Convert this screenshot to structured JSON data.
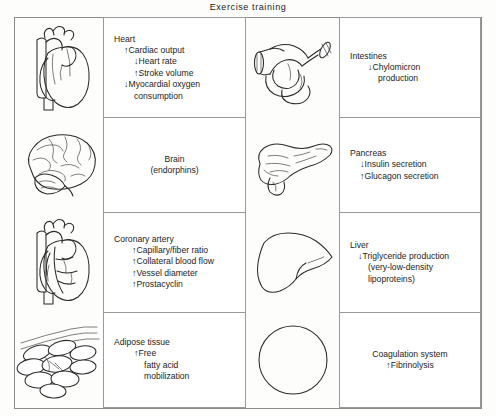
{
  "figure": {
    "title": "Exercise training"
  },
  "panels": [
    {
      "id": "heart",
      "illustration": "heart-anterior-illustration",
      "organ": "Heart",
      "effects": [
        {
          "arrow": "↑",
          "text": "Cardiac output"
        },
        {
          "arrow": "↓",
          "text": "Heart rate"
        },
        {
          "arrow": "↑",
          "text": "Stroke volume"
        },
        {
          "arrow": "↓",
          "text": "Myocardial oxygen"
        },
        {
          "arrow": "",
          "text": "consumption"
        }
      ]
    },
    {
      "id": "intestines",
      "illustration": "intestines-illustration",
      "organ": "Intestines",
      "effects": [
        {
          "arrow": "↓",
          "text": "Chylomicron"
        },
        {
          "arrow": "",
          "text": "production"
        }
      ]
    },
    {
      "id": "brain",
      "illustration": "brain-lateral-illustration",
      "organ": "Brain",
      "effects": [
        {
          "arrow": "",
          "text": "(endorphins)"
        }
      ]
    },
    {
      "id": "pancreas",
      "illustration": "pancreas-illustration",
      "organ": "Pancreas",
      "effects": [
        {
          "arrow": "↓",
          "text": "Insulin secretion"
        },
        {
          "arrow": "↑",
          "text": "Glucagon secretion"
        }
      ]
    },
    {
      "id": "coronary-artery",
      "illustration": "heart-coronary-vessels-illustration",
      "organ": "Coronary artery",
      "effects": [
        {
          "arrow": "↑",
          "text": "Capillary/fiber ratio"
        },
        {
          "arrow": "↑",
          "text": "Collateral blood flow"
        },
        {
          "arrow": "↑",
          "text": "Vessel diameter"
        },
        {
          "arrow": "↑",
          "text": "Prostacyclin"
        }
      ]
    },
    {
      "id": "liver",
      "illustration": "liver-illustration",
      "organ": "Liver",
      "effects": [
        {
          "arrow": "↓",
          "text": "Triglyceride production"
        },
        {
          "arrow": "",
          "text": "(very-low-density"
        },
        {
          "arrow": "",
          "text": "lipoproteins)"
        }
      ]
    },
    {
      "id": "adipose-tissue",
      "illustration": "adipose-tissue-illustration",
      "organ": "Adipose tissue",
      "effects": [
        {
          "arrow": "↑",
          "text": "Free"
        },
        {
          "arrow": "",
          "text": "fatty acid"
        },
        {
          "arrow": "",
          "text": "mobilization"
        }
      ]
    },
    {
      "id": "coagulation-system",
      "illustration": "blood-cell-circle-illustration",
      "organ": "Coagulation system",
      "effects": [
        {
          "arrow": "↑",
          "text": "Fibrinolysis"
        }
      ]
    }
  ],
  "colors": {
    "ink": "#2b2b2b",
    "rule": "#9a9a9a",
    "background": "#ffffff"
  }
}
